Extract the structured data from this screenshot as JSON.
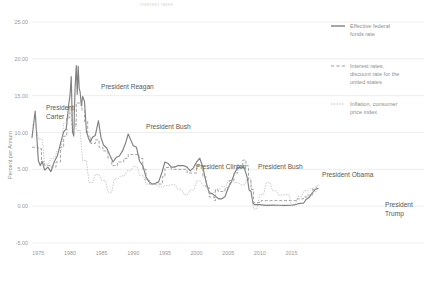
{
  "page": {
    "partial_title": "Interest rates"
  },
  "axes": {
    "ylabel": "Percent per Annum",
    "yticks": [
      "25.00",
      "20.00",
      "15.00",
      "10.00",
      "5.00",
      "0.00",
      "-5.00"
    ],
    "xticks": [
      "1975",
      "1980",
      "1985",
      "1990",
      "1995",
      "2000",
      "2005",
      "2010",
      "2015"
    ]
  },
  "legend": {
    "items": [
      {
        "name": "legend-effective-federal-funds-rate",
        "label": "Effective federal funds rate",
        "style": "solid",
        "color": "#808080"
      },
      {
        "name": "legend-discount-rate",
        "label": "Interest rates, discount rate for the united states",
        "style": "dashed",
        "color": "#9b9b9b"
      },
      {
        "name": "legend-inflation-cpi",
        "label": "Inflation, consumer price index",
        "style": "dotted",
        "color": "#b4b4b4"
      }
    ]
  },
  "annotations": [
    {
      "name": "annotation-president-carter",
      "lines": [
        "President",
        "Carter"
      ],
      "x": 46,
      "y": 110
    },
    {
      "name": "annotation-president-reagan",
      "lines": [
        "President Reagan"
      ],
      "x": 101,
      "y": 89
    },
    {
      "name": "annotation-president-bush-41",
      "lines": [
        "President Bush"
      ],
      "x": 146,
      "y": 129
    },
    {
      "name": "annotation-president-clinton",
      "lines": [
        "President Clinton"
      ],
      "x": 196,
      "y": 169
    },
    {
      "name": "annotation-president-bush-43",
      "lines": [
        "President Bush"
      ],
      "x": 258,
      "y": 169
    },
    {
      "name": "annotation-president-obama",
      "lines": [
        "President Obama"
      ],
      "x": 322,
      "y": 177
    },
    {
      "name": "annotation-president-trump",
      "lines": [
        "President",
        "Trump"
      ],
      "x": 385,
      "y": 207
    }
  ],
  "chart_data": {
    "type": "line",
    "title": "Interest rates",
    "xlabel": "",
    "ylabel": "Percent per Annum",
    "xlim": [
      1974.0,
      2019.5
    ],
    "ylim": [
      -5,
      25
    ],
    "grid": true,
    "legend_position": "right",
    "series": [
      {
        "name": "Effective federal funds rate",
        "style": "solid",
        "color": "#808080",
        "x": [
          1974.0,
          1974.5,
          1975.0,
          1975.3,
          1975.6,
          1976.0,
          1976.5,
          1977.0,
          1977.5,
          1978.0,
          1978.5,
          1979.0,
          1979.4,
          1979.8,
          1980.0,
          1980.2,
          1980.4,
          1980.6,
          1980.8,
          1981.0,
          1981.15,
          1981.3,
          1981.45,
          1981.6,
          1981.8,
          1982.0,
          1982.3,
          1982.6,
          1982.9,
          1983.2,
          1983.6,
          1984.0,
          1984.5,
          1984.9,
          1985.3,
          1985.8,
          1986.3,
          1986.8,
          1987.3,
          1987.8,
          1988.3,
          1988.8,
          1989.2,
          1989.6,
          1990.0,
          1990.5,
          1991.0,
          1991.5,
          1992.0,
          1992.5,
          1993.0,
          1993.5,
          1994.0,
          1994.5,
          1995.0,
          1995.5,
          1996.0,
          1996.5,
          1997.0,
          1997.5,
          1998.0,
          1998.5,
          1999.0,
          1999.5,
          2000.0,
          2000.5,
          2001.0,
          2001.3,
          2001.6,
          2002.0,
          2002.5,
          2003.0,
          2003.5,
          2004.0,
          2004.5,
          2005.0,
          2005.5,
          2006.0,
          2006.5,
          2007.0,
          2007.5,
          2008.0,
          2008.3,
          2008.6,
          2008.9,
          2009.2,
          2010.0,
          2011.0,
          2012.0,
          2013.0,
          2014.0,
          2015.0,
          2015.8,
          2016.3,
          2016.9,
          2017.3,
          2017.8,
          2018.3,
          2018.8,
          2019.2
        ],
        "y": [
          9.3,
          12.9,
          6.2,
          5.5,
          6.1,
          4.9,
          5.3,
          4.7,
          6.0,
          6.8,
          8.5,
          10.1,
          10.5,
          13.8,
          15.0,
          17.6,
          10.1,
          9.5,
          15.9,
          19.1,
          15.2,
          19.0,
          16.0,
          15.5,
          13.6,
          14.9,
          14.2,
          10.1,
          9.3,
          8.7,
          9.4,
          9.6,
          11.6,
          9.3,
          8.3,
          7.9,
          6.9,
          6.0,
          6.6,
          6.8,
          7.5,
          8.6,
          9.8,
          9.0,
          8.2,
          8.0,
          6.1,
          5.5,
          4.0,
          3.3,
          3.0,
          3.1,
          3.3,
          4.5,
          6.0,
          5.8,
          5.3,
          5.3,
          5.5,
          5.5,
          5.5,
          5.3,
          4.8,
          5.2,
          6.0,
          6.5,
          5.3,
          4.0,
          3.0,
          1.8,
          1.7,
          1.3,
          1.0,
          1.0,
          1.3,
          2.5,
          3.3,
          4.5,
          5.2,
          5.3,
          5.3,
          3.9,
          2.2,
          2.0,
          0.4,
          0.2,
          0.2,
          0.1,
          0.15,
          0.12,
          0.1,
          0.12,
          0.25,
          0.38,
          0.4,
          0.9,
          1.2,
          1.8,
          2.3,
          2.4
        ]
      },
      {
        "name": "Interest rates, discount rate for the united states",
        "style": "dashed",
        "color": "#9b9b9b",
        "x": [
          1974.0,
          1975.0,
          1975.5,
          1976.0,
          1977.0,
          1977.8,
          1978.5,
          1979.0,
          1979.5,
          1980.0,
          1980.3,
          1980.6,
          1981.0,
          1981.5,
          1981.9,
          1982.3,
          1982.8,
          1983.3,
          1984.0,
          1984.6,
          1985.2,
          1986.0,
          1986.6,
          1987.5,
          1988.5,
          1989.2,
          1990.0,
          1990.9,
          1991.5,
          1992.0,
          1992.6,
          1994.0,
          1994.6,
          1995.0,
          1996.0,
          1997.0,
          1998.5,
          1999.5,
          2000.0,
          2001.0,
          2001.5,
          2002.0,
          2002.8,
          2003.0,
          2003.4,
          2004.5,
          2005.2,
          2005.9,
          2006.5,
          2007.3,
          2007.8,
          2008.2,
          2008.6,
          2009.0,
          2010.2,
          2011.0,
          2013.0,
          2015.0,
          2015.9,
          2016.9,
          2017.5,
          2018.3,
          2018.9,
          2019.2
        ],
        "y": [
          8.0,
          7.8,
          6.0,
          5.5,
          5.3,
          6.0,
          8.0,
          9.5,
          12.0,
          13.0,
          11.0,
          11.0,
          14.0,
          14.0,
          13.0,
          11.5,
          9.5,
          8.5,
          9.0,
          8.0,
          7.5,
          6.5,
          5.5,
          6.0,
          6.5,
          7.0,
          7.0,
          6.5,
          5.0,
          3.5,
          3.0,
          3.0,
          4.0,
          5.25,
          5.0,
          5.0,
          4.5,
          4.5,
          5.5,
          4.0,
          2.5,
          1.25,
          0.75,
          2.25,
          2.0,
          2.5,
          3.5,
          4.5,
          5.5,
          6.25,
          5.5,
          3.5,
          2.25,
          0.5,
          0.75,
          0.75,
          0.75,
          0.75,
          1.0,
          1.25,
          1.5,
          2.25,
          2.75,
          2.75
        ]
      },
      {
        "name": "Inflation, consumer price index",
        "style": "dotted",
        "color": "#b4b4b4",
        "x": [
          1974.0,
          1974.6,
          1975.0,
          1975.6,
          1976.0,
          1976.6,
          1977.0,
          1977.6,
          1978.0,
          1978.6,
          1979.0,
          1979.6,
          1980.0,
          1980.5,
          1981.0,
          1981.6,
          1982.0,
          1982.6,
          1983.0,
          1983.6,
          1984.0,
          1984.6,
          1985.0,
          1985.6,
          1986.0,
          1986.6,
          1987.0,
          1987.6,
          1988.0,
          1988.6,
          1989.0,
          1989.6,
          1990.0,
          1990.6,
          1991.0,
          1991.6,
          1992.0,
          1992.6,
          1993.0,
          1993.6,
          1994.0,
          1994.6,
          1995.0,
          1995.6,
          1996.0,
          1996.6,
          1997.0,
          1997.6,
          1998.0,
          1998.6,
          1999.0,
          1999.6,
          2000.0,
          2000.6,
          2001.0,
          2001.6,
          2002.0,
          2002.6,
          2003.0,
          2003.6,
          2004.0,
          2004.6,
          2005.0,
          2005.6,
          2006.0,
          2006.6,
          2007.0,
          2007.6,
          2008.0,
          2008.5,
          2009.0,
          2009.5,
          2010.0,
          2010.6,
          2011.0,
          2011.6,
          2012.0,
          2012.6,
          2013.0,
          2013.6,
          2014.0,
          2014.6,
          2015.0,
          2015.6,
          2016.0,
          2016.6,
          2017.0,
          2017.6,
          2018.0,
          2018.6,
          2019.0
        ],
        "y": [
          11.0,
          11.0,
          9.1,
          9.1,
          5.7,
          5.7,
          6.5,
          6.5,
          7.6,
          7.6,
          11.3,
          11.3,
          13.5,
          13.5,
          10.3,
          10.3,
          6.2,
          6.2,
          3.2,
          3.2,
          4.3,
          4.3,
          3.5,
          3.5,
          1.9,
          1.9,
          3.7,
          3.7,
          4.1,
          4.1,
          4.8,
          4.8,
          5.4,
          5.4,
          4.2,
          4.2,
          3.0,
          3.0,
          3.0,
          3.0,
          2.6,
          2.6,
          2.8,
          2.8,
          2.9,
          2.9,
          2.3,
          2.3,
          1.6,
          1.6,
          2.2,
          2.2,
          3.4,
          3.4,
          2.8,
          2.8,
          1.6,
          1.6,
          2.3,
          2.3,
          2.7,
          2.7,
          3.4,
          3.4,
          3.2,
          3.2,
          2.9,
          2.9,
          3.8,
          3.8,
          -0.4,
          -0.4,
          1.6,
          1.6,
          3.2,
          3.2,
          2.1,
          2.1,
          1.5,
          1.5,
          1.6,
          1.6,
          0.1,
          0.1,
          1.3,
          1.3,
          2.1,
          2.1,
          2.4,
          2.4,
          1.8
        ]
      }
    ]
  }
}
